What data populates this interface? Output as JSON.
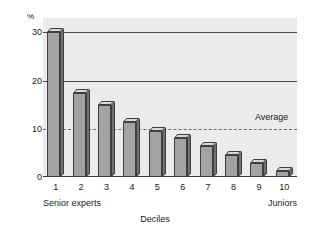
{
  "chart_data": {
    "type": "bar",
    "title": "",
    "subtitle": "",
    "xlabel": "Deciles",
    "ylabel": "%",
    "categories": [
      "1",
      "2",
      "3",
      "4",
      "5",
      "6",
      "7",
      "8",
      "9",
      "10"
    ],
    "values": [
      30,
      17.5,
      15,
      11.5,
      9.5,
      8,
      6.5,
      4.5,
      3,
      1.3
    ],
    "ylim": [
      0,
      33
    ],
    "y_ticks": [
      0,
      10,
      20,
      30
    ],
    "y_tick_labels": [
      "0",
      "10",
      "20",
      "30"
    ],
    "gridlines": [
      {
        "value": 30,
        "style": "solid"
      },
      {
        "value": 20,
        "style": "solid"
      },
      {
        "value": 10,
        "style": "dashed"
      }
    ],
    "grid": true,
    "legend": "none",
    "annotations": [
      {
        "name": "average-line-label",
        "text": "Average",
        "value": 10
      }
    ],
    "axis_end_labels": {
      "left": "Senior experts",
      "right": "Juniors"
    },
    "colors": {
      "bar_front": "#a3a3a3",
      "bar_side": "#707070",
      "bar_top": "#d8d8d8",
      "bar_outline": "#3f3f3f",
      "plot_background": "#ebebeb",
      "gridline": "#4a4a4a",
      "average_line": "#6e6e6e",
      "text": "#1a1a1a",
      "page_background": "#ffffff"
    }
  }
}
